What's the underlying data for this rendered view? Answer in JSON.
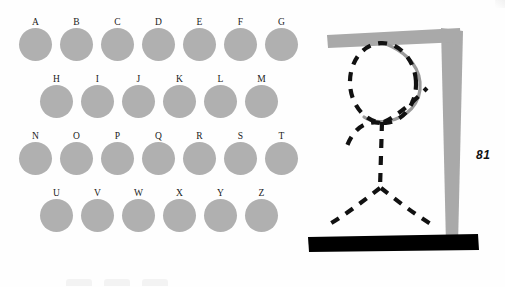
{
  "page": {
    "number": "81",
    "background_color": "#fefefe"
  },
  "letter_board": {
    "name": "alphabet-letter-board",
    "disc_color": "#b0b0b0",
    "label_color": "#1a1a1a",
    "rows": [
      {
        "letters": [
          "A",
          "B",
          "C",
          "D",
          "E",
          "F",
          "G"
        ]
      },
      {
        "letters": [
          "H",
          "I",
          "J",
          "K",
          "L",
          "M"
        ]
      },
      {
        "letters": [
          "N",
          "O",
          "P",
          "Q",
          "R",
          "S",
          "T"
        ]
      },
      {
        "letters": [
          "U",
          "V",
          "W",
          "X",
          "Y",
          "Z"
        ]
      }
    ]
  },
  "hangman": {
    "name": "hangman-gallows-illustration",
    "gallows_color": "#a9a9a9",
    "rope_color": "#9a9a9a",
    "figure_color": "#111111",
    "base_color": "#000000",
    "parts": [
      "base-platform",
      "vertical-post",
      "horizontal-beam",
      "rope",
      "head",
      "body",
      "left-arm",
      "right-arm",
      "left-leg",
      "right-leg"
    ],
    "state": "complete-figure"
  },
  "word_blanks": {
    "name": "word-blank-lines",
    "count": 3
  }
}
